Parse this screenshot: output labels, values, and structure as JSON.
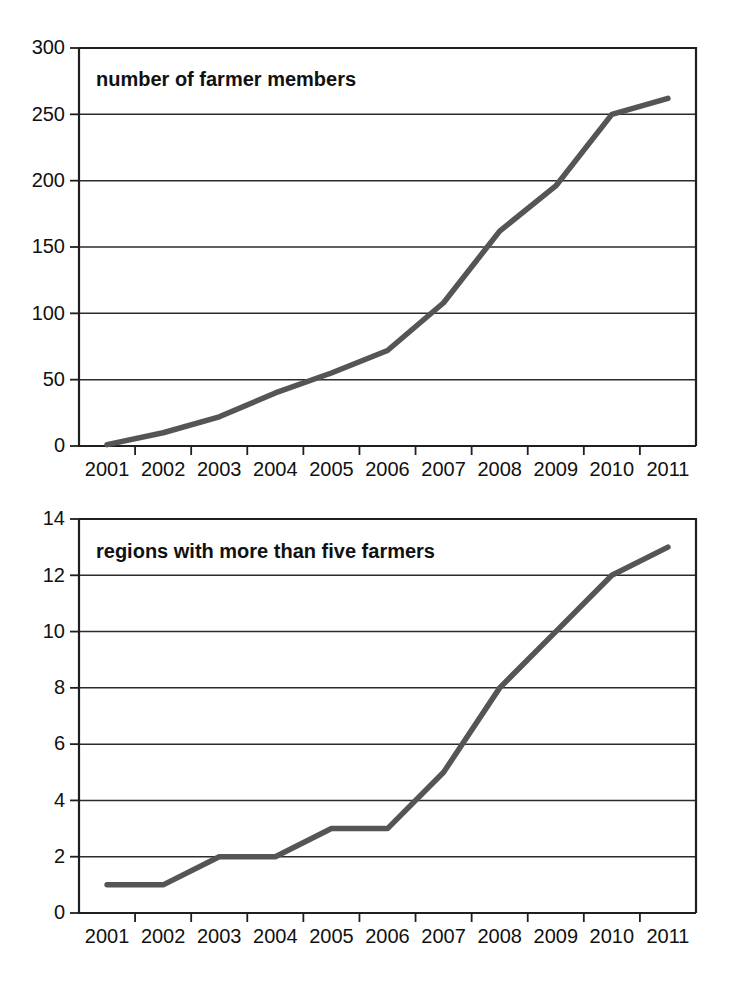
{
  "page": {
    "background_color": "#ffffff",
    "width": 730,
    "height": 984
  },
  "style": {
    "line_color": "#555555",
    "axis_color": "#1f1f1f",
    "grid_color": "#2b2b2b",
    "text_color": "#111111"
  },
  "charts": [
    {
      "id": "farmer-members",
      "caption": "number of farmer members",
      "y_ticks": [
        "0",
        "50",
        "100",
        "150",
        "200",
        "250",
        "300"
      ],
      "x_ticks": [
        "2001",
        "2002",
        "2003",
        "2004",
        "2005",
        "2006",
        "2007",
        "2008",
        "2009",
        "2010",
        "2011"
      ]
    },
    {
      "id": "regions-five-farmers",
      "caption": "regions with more than five farmers",
      "y_ticks": [
        "0",
        "2",
        "4",
        "6",
        "8",
        "10",
        "12",
        "14"
      ],
      "x_ticks": [
        "2001",
        "2002",
        "2003",
        "2004",
        "2005",
        "2006",
        "2007",
        "2008",
        "2009",
        "2010",
        "2011"
      ]
    }
  ],
  "chart_data": [
    {
      "type": "line",
      "title": "number of farmer members",
      "xlabel": "",
      "ylabel": "",
      "categories": [
        "2001",
        "2002",
        "2003",
        "2004",
        "2005",
        "2006",
        "2007",
        "2008",
        "2009",
        "2010",
        "2011"
      ],
      "values": [
        1,
        10,
        22,
        40,
        55,
        72,
        108,
        162,
        196,
        250,
        262
      ],
      "ylim": [
        0,
        300
      ],
      "ytick_values": [
        0,
        50,
        100,
        150,
        200,
        250,
        300
      ],
      "grid": "horizontal",
      "legend": "none",
      "series_color": "#555555"
    },
    {
      "type": "line",
      "title": "regions with more than five farmers",
      "xlabel": "",
      "ylabel": "",
      "categories": [
        "2001",
        "2002",
        "2003",
        "2004",
        "2005",
        "2006",
        "2007",
        "2008",
        "2009",
        "2010",
        "2011"
      ],
      "values": [
        1,
        1,
        2,
        2,
        3,
        3,
        5,
        8,
        10,
        12,
        13
      ],
      "ylim": [
        0,
        14
      ],
      "ytick_values": [
        0,
        2,
        4,
        6,
        8,
        10,
        12,
        14
      ],
      "grid": "horizontal",
      "legend": "none",
      "series_color": "#555555"
    }
  ]
}
